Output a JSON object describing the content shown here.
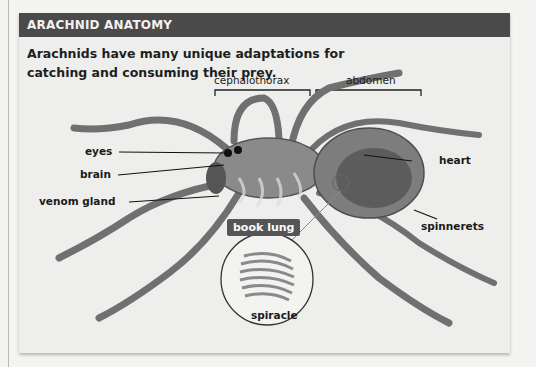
{
  "figure": {
    "title": "ARACHNID ANATOMY",
    "caption": "Arachnids have many unique adaptations for catching and consuming their prey.",
    "body_regions": [
      {
        "id": "cephalothorax",
        "label": "cephalothorax"
      },
      {
        "id": "abdomen",
        "label": "abdomen"
      }
    ],
    "labels": {
      "eyes": "eyes",
      "brain": "brain",
      "venom_gland": "venom gland",
      "heart": "heart",
      "spinnerets": "spinnerets",
      "book_lung": "book lung",
      "spiracle": "spiracle"
    },
    "colors": {
      "title_bar": "#4a4a4a",
      "panel": "#eeeeec",
      "book_lung_tag": "#555555"
    }
  }
}
